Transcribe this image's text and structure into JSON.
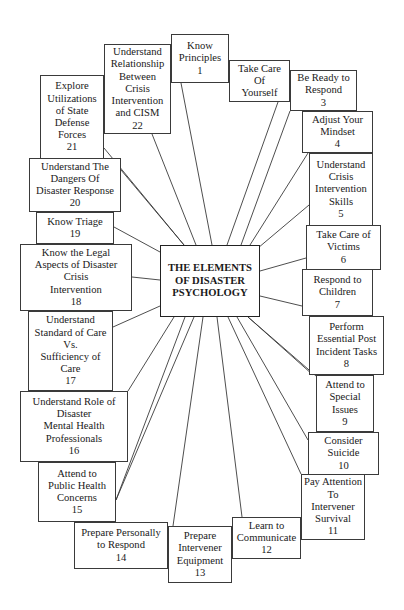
{
  "diagram": {
    "title": "THE ELEMENTS\nOF DISASTER\nPSYCHOLOGY",
    "center_box": {
      "x": 160,
      "y": 245,
      "w": 100,
      "h": 72
    },
    "line_color": "#3a3a3a",
    "elements": [
      {
        "id": 1,
        "label": "Know\nPrinciples\n1",
        "x": 171,
        "y": 34,
        "w": 58,
        "h": 49,
        "anchor": [
          181,
          83
        ]
      },
      {
        "id": 2,
        "label": "Take Care\nOf\nYourself",
        "x": 229,
        "y": 60,
        "w": 61,
        "h": 42,
        "anchor": [
          278,
          102
        ]
      },
      {
        "id": 3,
        "label": "Be Ready to\nRespond\n3",
        "x": 290,
        "y": 70,
        "w": 67,
        "h": 41,
        "anchor": [
          290,
          111
        ]
      },
      {
        "id": 4,
        "label": "Adjust Your\nMindset\n4",
        "x": 302,
        "y": 111,
        "w": 71,
        "h": 42,
        "anchor": [
          308,
          153
        ]
      },
      {
        "id": 5,
        "label": "Understand\nCrisis\nIntervention\nSkills\n5",
        "x": 309,
        "y": 153,
        "w": 64,
        "h": 73,
        "anchor": [
          309,
          205
        ]
      },
      {
        "id": 6,
        "label": "Take Care of\nVictims\n6",
        "x": 306,
        "y": 225,
        "w": 75,
        "h": 45,
        "anchor": [
          306,
          258
        ]
      },
      {
        "id": 7,
        "label": "Respond to\nChildren\n7",
        "x": 302,
        "y": 269,
        "w": 71,
        "h": 47,
        "anchor": [
          302,
          306
        ]
      },
      {
        "id": 8,
        "label": "Perform\nEssential Post\nIncident Tasks\n8",
        "x": 309,
        "y": 316,
        "w": 75,
        "h": 59,
        "anchor": [
          313,
          375
        ]
      },
      {
        "id": 9,
        "label": "Attend to\nSpecial\nIssues\n9",
        "x": 316,
        "y": 375,
        "w": 58,
        "h": 57,
        "anchor": [
          316,
          376
        ]
      },
      {
        "id": 10,
        "label": "Consider\nSuicide\n10",
        "x": 308,
        "y": 432,
        "w": 71,
        "h": 43,
        "anchor": [
          308,
          440
        ]
      },
      {
        "id": 11,
        "label": "Pay Attention\nTo\nIntervener\nSurvival\n11",
        "x": 301,
        "y": 474,
        "w": 64,
        "h": 66,
        "anchor": [
          301,
          474
        ]
      },
      {
        "id": 12,
        "label": "Learn to\nCommunicate\n12",
        "x": 232,
        "y": 517,
        "w": 69,
        "h": 42,
        "anchor": [
          242,
          517
        ]
      },
      {
        "id": 13,
        "label": "Prepare\nIntervener\nEquipment\n13",
        "x": 168,
        "y": 526,
        "w": 64,
        "h": 57,
        "anchor": [
          173,
          526
        ]
      },
      {
        "id": 14,
        "label": "Prepare Personally\nto Respond\n14",
        "x": 74,
        "y": 522,
        "w": 94,
        "h": 47,
        "anchor": [
          116,
          500
        ]
      },
      {
        "id": 15,
        "label": "Attend to\nPublic Health\nConcerns\n15",
        "x": 38,
        "y": 462,
        "w": 78,
        "h": 60,
        "anchor": [
          116,
          500
        ]
      },
      {
        "id": 16,
        "label": "Understand Role of\nDisaster\nMental Health\nProfessionals\n16",
        "x": 20,
        "y": 391,
        "w": 108,
        "h": 71,
        "anchor": [
          128,
          391
        ]
      },
      {
        "id": 17,
        "label": "Understand\nStandard of Care\nVs.\nSufficiency of\nCare\n17",
        "x": 28,
        "y": 311,
        "w": 85,
        "h": 80,
        "anchor": [
          113,
          327
        ]
      },
      {
        "id": 18,
        "label": "Know the Legal\nAspects of Disaster\nCrisis\nIntervention\n18",
        "x": 20,
        "y": 244,
        "w": 112,
        "h": 67,
        "anchor": [
          132,
          277
        ]
      },
      {
        "id": 19,
        "label": "Know Triage\n19",
        "x": 36,
        "y": 212,
        "w": 78,
        "h": 32,
        "anchor": [
          114,
          227
        ]
      },
      {
        "id": 20,
        "label": "Understand The\nDangers Of\nDisaster Response\n20",
        "x": 29,
        "y": 158,
        "w": 92,
        "h": 54,
        "anchor": [
          121,
          170
        ]
      },
      {
        "id": 21,
        "label": "Explore\nUtilizations\nof State\nDefense\nForces\n21",
        "x": 40,
        "y": 75,
        "w": 64,
        "h": 84,
        "anchor": [
          104,
          148
        ]
      },
      {
        "id": 22,
        "label": "Understand\nRelationship\nBetween\nCrisis\nIntervention\nand CISM\n22",
        "x": 104,
        "y": 44,
        "w": 67,
        "h": 90,
        "anchor": [
          152,
          134
        ]
      }
    ],
    "connectors": [
      {
        "to": 1,
        "from": [
          212,
          245
        ]
      },
      {
        "to": 2,
        "from": [
          227,
          245
        ]
      },
      {
        "to": 3,
        "from": [
          241,
          245
        ]
      },
      {
        "to": 4,
        "from": [
          250,
          245
        ]
      },
      {
        "to": 5,
        "from": [
          258,
          248
        ]
      },
      {
        "to": 6,
        "from": [
          260,
          271
        ]
      },
      {
        "to": 7,
        "from": [
          260,
          296
        ]
      },
      {
        "to": 8,
        "from": [
          248,
          317
        ]
      },
      {
        "to": 9,
        "from": [
          248,
          317
        ]
      },
      {
        "to": 10,
        "from": [
          237,
          317
        ]
      },
      {
        "to": 11,
        "from": [
          228,
          317
        ]
      },
      {
        "to": 12,
        "from": [
          217,
          317
        ]
      },
      {
        "to": 13,
        "from": [
          203,
          317
        ]
      },
      {
        "to": 14,
        "from": [
          194,
          317
        ]
      },
      {
        "to": 15,
        "from": [
          185,
          317
        ]
      },
      {
        "to": 16,
        "from": [
          174,
          317
        ]
      },
      {
        "to": 17,
        "from": [
          160,
          306
        ]
      },
      {
        "to": 18,
        "from": [
          160,
          280
        ]
      },
      {
        "to": 19,
        "from": [
          160,
          252
        ]
      },
      {
        "to": 20,
        "from": [
          184,
          245
        ]
      },
      {
        "to": 21,
        "from": [
          184,
          245
        ]
      },
      {
        "to": 22,
        "from": [
          196,
          245
        ]
      }
    ]
  }
}
